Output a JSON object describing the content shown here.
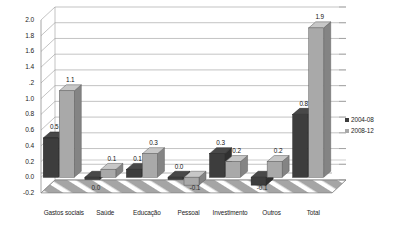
{
  "chart_data": {
    "type": "bar",
    "title": "",
    "subtitle": "",
    "xlabel": "",
    "ylabel": "",
    "categories": [
      "Gastos sociais",
      "Saúde",
      "Educação",
      "Pessoal",
      "Investimento",
      "Outros",
      "Total"
    ],
    "series": [
      {
        "name": "2004-08",
        "color": "#3d3d3d",
        "values": [
          0.5,
          0.0,
          0.1,
          0.0,
          0.3,
          -0.1,
          0.8
        ],
        "labels": [
          "0.5",
          "0.0",
          "0.1",
          "0.0",
          "0.3",
          "-0.1",
          "0.8"
        ]
      },
      {
        "name": "2008-12",
        "color": "#a9a9a9",
        "values": [
          1.1,
          0.1,
          0.3,
          -0.1,
          0.2,
          0.2,
          1.9
        ],
        "labels": [
          "1.1",
          "0.1",
          "0.3",
          "-0.1",
          "0.2",
          "0.2",
          "1.9"
        ]
      }
    ],
    "ylim": [
      -0.2,
      2.0
    ],
    "ytick_step": 0.2,
    "ytick_labels": [
      "2.0",
      "1.8",
      "1.6",
      "1.4",
      ".2",
      "1.0",
      "0.8",
      "0.6",
      "0.4",
      "0.2",
      "0.0",
      "-0.2"
    ],
    "ytick_values": [
      2.0,
      1.8,
      1.6,
      1.4,
      1.2,
      1.0,
      0.8,
      0.6,
      0.4,
      0.2,
      0.0,
      -0.2
    ],
    "grid": true,
    "legend_position": "right",
    "style": "3d-clustered-column",
    "floor_band": {
      "fill": "#a5a5a5",
      "hatch": "#ffffff"
    },
    "gridline_color": "#9a9a9a",
    "plot_background": "#ffffff"
  },
  "legend": {
    "items": [
      {
        "label": "2004-08",
        "color": "#3d3d3d"
      },
      {
        "label": "2008-12",
        "color": "#a9a9a9"
      }
    ]
  }
}
